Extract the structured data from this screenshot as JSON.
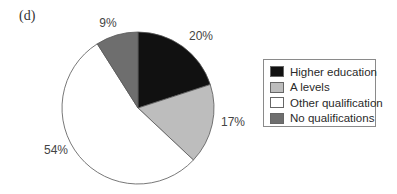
{
  "figure": {
    "panel_label": "(d)"
  },
  "chart_data": {
    "type": "pie",
    "title": "",
    "panel_label": "(d)",
    "categories": [
      "Higher education",
      "A levels",
      "Other qualification",
      "No qualifications"
    ],
    "values": [
      20,
      17,
      54,
      9
    ],
    "unit": "%",
    "data_labels": [
      "20%",
      "17%",
      "54%",
      "9%"
    ],
    "colors": [
      "#111111",
      "#bdbdbd",
      "#ffffff",
      "#6e6e6e"
    ],
    "start_angle_deg": 0,
    "direction": "clockwise",
    "legend": {
      "position": "right",
      "entries": [
        "Higher education",
        "A levels",
        "Other qualification",
        "No qualifications"
      ]
    }
  },
  "labels": {
    "higher_education": "20%",
    "a_levels": "17%",
    "other_qualification": "54%",
    "no_qualifications": "9%"
  },
  "legend": {
    "items": [
      {
        "label": "Higher education",
        "color": "#111111"
      },
      {
        "label": "A levels",
        "color": "#bdbdbd"
      },
      {
        "label": "Other qualification",
        "color": "#ffffff"
      },
      {
        "label": "No qualifications",
        "color": "#6e6e6e"
      }
    ]
  }
}
